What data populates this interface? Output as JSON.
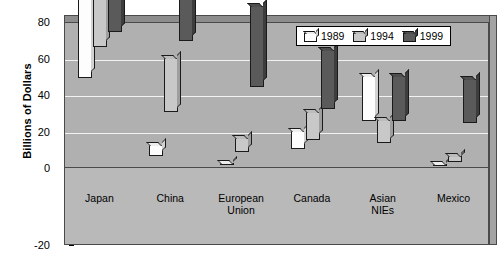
{
  "chart_data": {
    "type": "bar",
    "title": "",
    "xlabel": "",
    "ylabel": "Billions of Dollars",
    "ylim": [
      -20,
      80
    ],
    "yticks": [
      -20,
      0,
      20,
      40,
      60,
      80
    ],
    "ytick_labels": [
      "-20",
      "0",
      "20",
      "40",
      "60",
      "80"
    ],
    "grid": true,
    "gridlines_at": [
      20,
      40,
      60
    ],
    "legend_position": "top-right",
    "categories": [
      "Japan",
      "China",
      "European\nUnion",
      "Canada",
      "Asian\nNIEs",
      "Mexico"
    ],
    "series": [
      {
        "name": "1989",
        "color": "#fdfdfd",
        "values": [
          49,
          6,
          1,
          10,
          25,
          0.5
        ]
      },
      {
        "name": "1994",
        "color": "#c8c8c8",
        "values": [
          66,
          30,
          8,
          15,
          13,
          3
        ]
      },
      {
        "name": "1999",
        "color": "#5a5a5a",
        "values": [
          74,
          69,
          44,
          32,
          25,
          24
        ]
      }
    ]
  },
  "colors": {
    "plot_background": "#b0b0b0",
    "floor_background": "#b9b9b9",
    "gridline": "#f2f2f2",
    "axis": "#000000",
    "legend_background": "#ffffff"
  }
}
